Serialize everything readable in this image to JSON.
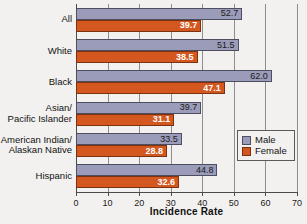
{
  "chart_data": {
    "type": "bar",
    "orientation": "horizontal",
    "title": "",
    "xlabel": "Incidence Rate",
    "ylabel": "",
    "xlim": [
      0,
      70
    ],
    "xticks": [
      0,
      10,
      20,
      30,
      40,
      50,
      60,
      70
    ],
    "grid": true,
    "legend_position": "right",
    "categories": [
      "All",
      "White",
      "Black",
      "Asian/ Pacific Islander",
      "American Indian/ Alaskan Native",
      "Hispanic"
    ],
    "category_lines": [
      [
        "All"
      ],
      [
        "White"
      ],
      [
        "Black"
      ],
      [
        "Asian/",
        "Pacific Islander"
      ],
      [
        "American Indian/",
        "Alaskan Native"
      ],
      [
        "Hispanic"
      ]
    ],
    "series": [
      {
        "name": "Male",
        "color": "#9b9cba",
        "values": [
          52.7,
          51.5,
          62.0,
          39.7,
          33.5,
          44.8
        ],
        "labels": [
          "52.7",
          "51.5",
          "62.0",
          "39.7",
          "33.5",
          "44.8"
        ]
      },
      {
        "name": "Female",
        "color": "#d4571f",
        "values": [
          39.7,
          38.5,
          47.1,
          31.1,
          28.8,
          32.6
        ],
        "labels": [
          "39.7",
          "38.5",
          "47.1",
          "31.1",
          "28.8",
          "32.6"
        ]
      }
    ],
    "tick_labels": [
      "0",
      "10",
      "20",
      "30",
      "40",
      "50",
      "60",
      "70"
    ]
  },
  "legend": {
    "items": [
      {
        "label": "Male",
        "color": "#9b9cba"
      },
      {
        "label": "Female",
        "color": "#d4571f"
      }
    ]
  }
}
